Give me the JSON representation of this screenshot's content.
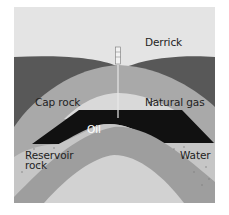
{
  "diagram": {
    "labels": {
      "derrick": "Derrick",
      "cap_rock": "Cap rock",
      "natural_gas": "Natural gas",
      "oil": "Oil",
      "reservoir_rock_line1": "Reservoir",
      "reservoir_rock_line2": "rock",
      "water": "Water"
    },
    "colors": {
      "sky": "#e4e4e4",
      "upper_strata": "#585858",
      "cap_rock": "#a9a9a9",
      "natural_gas": "#d9d9d9",
      "oil": "#111111",
      "reservoir_rock": "#c6c6c6",
      "inner_stratum": "#9e9e9e",
      "core_stratum": "#d2d2d2",
      "derrick": "#f2f2f2"
    }
  }
}
